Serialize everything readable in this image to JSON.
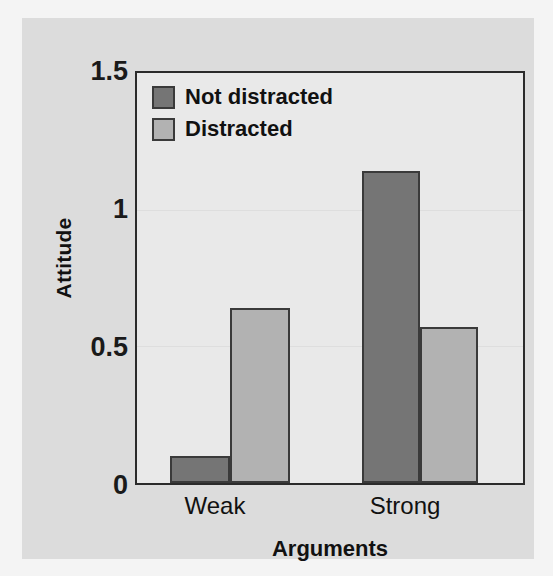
{
  "chart_data": {
    "type": "bar",
    "title": "",
    "xlabel": "Arguments",
    "ylabel": "Attitude",
    "categories": [
      "Weak",
      "Strong"
    ],
    "series": [
      {
        "name": "Not distracted",
        "color": "#757575",
        "values": [
          0.1,
          1.14
        ]
      },
      {
        "name": "Distracted",
        "color": "#b2b2b2",
        "values": [
          0.64,
          0.57
        ]
      }
    ],
    "ylim": [
      0,
      1.5
    ],
    "yticks": [
      0,
      0.5,
      1,
      1.5
    ],
    "ytick_labels": [
      "0",
      "0.5",
      "1",
      "1.5"
    ],
    "grid": true,
    "grid_axis": "y",
    "legend_position": "top-left"
  },
  "axes": {
    "y_title": "Attitude",
    "x_title": "Arguments",
    "y_tick_0": "0",
    "y_tick_1": "0.5",
    "y_tick_2": "1",
    "y_tick_3": "1.5",
    "x_tick_0": "Weak",
    "x_tick_1": "Strong"
  },
  "legend": {
    "items": [
      {
        "label": "Not distracted",
        "color": "#757575"
      },
      {
        "label": "Distracted",
        "color": "#b2b2b2"
      }
    ]
  },
  "colors": {
    "figure_background": "#dcdcdc",
    "plot_background": "#e9e9e9",
    "axis": "#2b2b2b",
    "bar_dark": "#757575",
    "bar_light": "#b2b2b2",
    "gridline": "#dedede",
    "text": "#111111"
  }
}
